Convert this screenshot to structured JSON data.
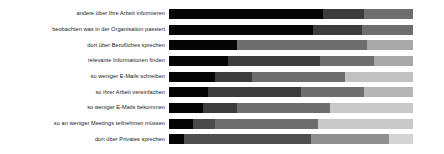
{
  "chart_data": {
    "type": "bar",
    "subtype": "stacked-horizontal-100-percent",
    "title": "",
    "subtitle": "",
    "xlabel": "",
    "ylabel": "",
    "xlim": [
      0,
      100
    ],
    "grid": false,
    "legend_position": "none",
    "orientation": "horizontal",
    "stacked": true,
    "categories": [
      "andere über Ihre Arbeit informieren",
      "beobachten was in der Organisation passiert",
      "dort über Berufliches sprechen",
      "relevante Informationen finden",
      "so weniger E-Mails schreiben",
      "so ihrer Arbeit vereinfachen",
      "so weniger E-Mails bekommen",
      "so an weniger Meetings teilnehmen müssen",
      "dort über Privates sprechen"
    ],
    "series": [
      {
        "name": "series-1",
        "color": "#050505",
        "values": [
          63,
          59,
          28,
          24,
          19,
          16,
          14,
          10,
          6
        ]
      },
      {
        "name": "series-2",
        "color": "#3c3c3c",
        "values": [
          17,
          20,
          0,
          38,
          15,
          38,
          14,
          9,
          52
        ]
      },
      {
        "name": "series-3",
        "color": "#6e6e6e",
        "values": [
          20,
          21,
          53,
          22,
          38,
          26,
          38,
          42,
          32
        ]
      },
      {
        "name": "series-4",
        "color": "#a8a8a8",
        "values": [
          0,
          0,
          19,
          16,
          28,
          20,
          34,
          39,
          10
        ]
      },
      {
        "name": "series-5",
        "color": "#d4d4d4",
        "values": [
          0,
          0,
          0,
          0,
          0,
          0,
          0,
          0,
          0
        ]
      }
    ],
    "rows": [
      {
        "label": "andere über Ihre Arbeit informieren",
        "segments": [
          {
            "name": "series-1",
            "value": 63,
            "color": "#050505"
          },
          {
            "name": "series-2",
            "value": 17,
            "color": "#3c3c3c"
          },
          {
            "name": "series-3",
            "value": 20,
            "color": "#6e6e6e"
          }
        ]
      },
      {
        "label": "beobachten was in der Organisation passiert",
        "segments": [
          {
            "name": "series-1",
            "value": 59,
            "color": "#050505"
          },
          {
            "name": "series-2",
            "value": 20,
            "color": "#3c3c3c"
          },
          {
            "name": "series-3",
            "value": 21,
            "color": "#6e6e6e"
          }
        ]
      },
      {
        "label": "dort über Berufliches sprechen",
        "segments": [
          {
            "name": "series-1",
            "value": 28,
            "color": "#050505"
          },
          {
            "name": "series-3",
            "value": 53,
            "color": "#6e6e6e"
          },
          {
            "name": "series-4",
            "value": 19,
            "color": "#a8a8a8"
          }
        ]
      },
      {
        "label": "relevante Informationen finden",
        "segments": [
          {
            "name": "series-1",
            "value": 24,
            "color": "#050505"
          },
          {
            "name": "series-2",
            "value": 38,
            "color": "#3c3c3c"
          },
          {
            "name": "series-3",
            "value": 22,
            "color": "#6e6e6e"
          },
          {
            "name": "series-4",
            "value": 16,
            "color": "#a8a8a8"
          }
        ]
      },
      {
        "label": "so weniger E-Mails schreiben",
        "segments": [
          {
            "name": "series-1",
            "value": 19,
            "color": "#050505"
          },
          {
            "name": "series-2",
            "value": 15,
            "color": "#3c3c3c"
          },
          {
            "name": "series-3",
            "value": 38,
            "color": "#6e6e6e"
          },
          {
            "name": "series-4",
            "value": 28,
            "color": "#c2c2c2"
          }
        ]
      },
      {
        "label": "so ihrer Arbeit vereinfachen",
        "segments": [
          {
            "name": "series-1",
            "value": 16,
            "color": "#050505"
          },
          {
            "name": "series-2",
            "value": 38,
            "color": "#3c3c3c"
          },
          {
            "name": "series-3",
            "value": 26,
            "color": "#6e6e6e"
          },
          {
            "name": "series-4",
            "value": 20,
            "color": "#b5b5b5"
          }
        ]
      },
      {
        "label": "so weniger E-Mails bekommen",
        "segments": [
          {
            "name": "series-1",
            "value": 14,
            "color": "#050505"
          },
          {
            "name": "series-2",
            "value": 14,
            "color": "#3c3c3c"
          },
          {
            "name": "series-3",
            "value": 38,
            "color": "#6e6e6e"
          },
          {
            "name": "series-4",
            "value": 34,
            "color": "#c9c9c9"
          }
        ]
      },
      {
        "label": "so an weniger Meetings teilnehmen müssen",
        "segments": [
          {
            "name": "series-1",
            "value": 10,
            "color": "#050505"
          },
          {
            "name": "series-2",
            "value": 9,
            "color": "#4a4a4a"
          },
          {
            "name": "series-3",
            "value": 42,
            "color": "#6e6e6e"
          },
          {
            "name": "series-4",
            "value": 39,
            "color": "#c9c9c9"
          }
        ]
      },
      {
        "label": "dort über Privates sprechen",
        "segments": [
          {
            "name": "series-1",
            "value": 6,
            "color": "#050505"
          },
          {
            "name": "series-2",
            "value": 52,
            "color": "#4f4f4f"
          },
          {
            "name": "series-3",
            "value": 32,
            "color": "#8f8f8f"
          },
          {
            "name": "series-4",
            "value": 10,
            "color": "#d4d4d4"
          }
        ]
      }
    ]
  }
}
